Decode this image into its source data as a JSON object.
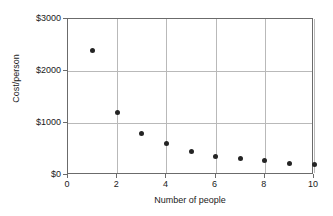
{
  "chart_data": {
    "type": "scatter",
    "title": "",
    "xlabel": "Number of people",
    "ylabel": "Cost/person",
    "xlim": [
      0,
      10
    ],
    "ylim": [
      0,
      3000
    ],
    "grid": true,
    "legend": null,
    "x_ticks": [
      0,
      2,
      4,
      6,
      8,
      10
    ],
    "x_tick_labels": [
      "0",
      "2",
      "4",
      "6",
      "8",
      "10"
    ],
    "y_ticks": [
      0,
      1000,
      2000,
      3000
    ],
    "y_tick_labels": [
      "$0",
      "$1000",
      "$2000",
      "$3000"
    ],
    "x_gridlines": [
      2,
      4,
      6,
      8,
      10
    ],
    "y_gridlines": [
      1000,
      2000
    ],
    "marker": "filled-circle",
    "marker_color": "#242424",
    "axis_color": "#6b6b6b",
    "grid_color": "#b9b9b9",
    "background_color": "#ffffff",
    "x": [
      1,
      2,
      3,
      4,
      5,
      6,
      7,
      8,
      9,
      10
    ],
    "values": [
      2400,
      1200,
      800,
      600,
      450,
      350,
      310,
      270,
      230,
      200
    ],
    "points": [
      {
        "x": 1,
        "y": 2400
      },
      {
        "x": 2,
        "y": 1200
      },
      {
        "x": 3,
        "y": 800
      },
      {
        "x": 4,
        "y": 600
      },
      {
        "x": 5,
        "y": 450
      },
      {
        "x": 6,
        "y": 350
      },
      {
        "x": 7,
        "y": 310
      },
      {
        "x": 8,
        "y": 270
      },
      {
        "x": 9,
        "y": 230
      },
      {
        "x": 10,
        "y": 200
      }
    ]
  }
}
